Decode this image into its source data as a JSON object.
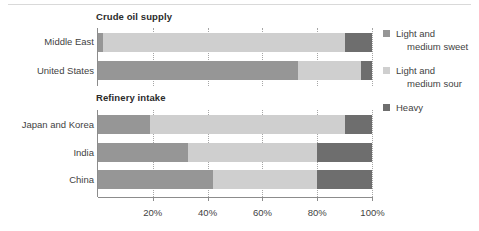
{
  "chart_data": {
    "type": "bar",
    "orientation": "horizontal",
    "stacked": true,
    "stack_mode": "percent",
    "panels": [
      {
        "title": "Crude oil supply",
        "categories": [
          "Middle East",
          "United States"
        ],
        "series": [
          {
            "name": "Light and medium sweet",
            "color": "#969696",
            "values": [
              2,
              73
            ]
          },
          {
            "name": "Light and medium sour",
            "color": "#cfcfcf",
            "values": [
              88,
              23
            ]
          },
          {
            "name": "Heavy",
            "color": "#6e6e6e",
            "values": [
              10,
              4
            ]
          }
        ]
      },
      {
        "title": "Refinery intake",
        "categories": [
          "Japan and Korea",
          "India",
          "China"
        ],
        "series": [
          {
            "name": "Light and medium sweet",
            "color": "#969696",
            "values": [
              19,
              33,
              42
            ]
          },
          {
            "name": "Light and medium sour",
            "color": "#cfcfcf",
            "values": [
              71,
              47,
              38
            ]
          },
          {
            "name": "Heavy",
            "color": "#6e6e6e",
            "values": [
              10,
              20,
              20
            ]
          }
        ]
      }
    ],
    "xlabel": "",
    "ylabel": "",
    "xlim": [
      0,
      100
    ],
    "xticks": [
      20,
      40,
      60,
      80,
      100
    ],
    "xtick_labels": [
      "20%",
      "40%",
      "60%",
      "80%",
      "100%"
    ],
    "gridlines": true,
    "grid_style": "dotted-vertical",
    "legend_position": "right",
    "legend": [
      {
        "label_line1": "Light and",
        "label_line2": "medium sweet",
        "color": "#969696"
      },
      {
        "label_line1": "Light and",
        "label_line2": "medium sour",
        "color": "#cfcfcf"
      },
      {
        "label_line1": "Heavy",
        "label_line2": "",
        "color": "#6e6e6e"
      }
    ]
  },
  "panels": {
    "crude": {
      "title": "Crude oil supply",
      "rows": [
        {
          "label": "Middle East",
          "sweet": 2,
          "sour": 88,
          "heavy": 10
        },
        {
          "label": "United States",
          "sweet": 73,
          "sour": 23,
          "heavy": 4
        }
      ]
    },
    "refinery": {
      "title": "Refinery intake",
      "rows": [
        {
          "label": "Japan and Korea",
          "sweet": 19,
          "sour": 71,
          "heavy": 10
        },
        {
          "label": "India",
          "sweet": 33,
          "sour": 47,
          "heavy": 20
        },
        {
          "label": "China",
          "sweet": 42,
          "sour": 38,
          "heavy": 20
        }
      ]
    }
  },
  "axis": {
    "tick_labels": [
      "20%",
      "40%",
      "60%",
      "80%",
      "100%"
    ]
  },
  "legend": {
    "items": [
      {
        "line1": "Light and",
        "line2": "medium sweet"
      },
      {
        "line1": "Light and",
        "line2": "medium sour"
      },
      {
        "line1": "Heavy",
        "line2": ""
      }
    ]
  },
  "colors": {
    "sweet": "#969696",
    "sour": "#cfcfcf",
    "heavy": "#6e6e6e",
    "axis": "#8c8c8c",
    "grid": "#a6a6a6",
    "text": "#3f3f3f"
  }
}
